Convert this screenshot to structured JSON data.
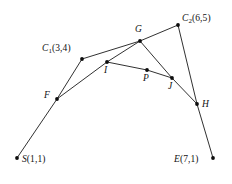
{
  "figure": {
    "width": 232,
    "height": 184,
    "background_color": "#ffffff",
    "stroke_color": "#1a1a1a",
    "point_color": "#0d0d0d"
  },
  "points": [
    {
      "id": "S",
      "label": "S(1,1)",
      "name": "S",
      "coord_text": "(1,1)",
      "x": 17,
      "y": 158,
      "label_x": 22,
      "label_y": 155,
      "has_sub": false
    },
    {
      "id": "C1",
      "label": "C1(3,4)",
      "name": "C",
      "sub": "1",
      "coord_text": "(3,4)",
      "x": 82,
      "y": 59,
      "label_x": 42,
      "label_y": 44,
      "has_sub": true
    },
    {
      "id": "C2",
      "label": "C2(6,5)",
      "name": "C",
      "sub": "2",
      "coord_text": "(6,5)",
      "x": 178,
      "y": 25,
      "label_x": 182,
      "label_y": 14,
      "has_sub": true
    },
    {
      "id": "E",
      "label": "E(7,1)",
      "name": "E",
      "coord_text": "(7,1)",
      "x": 213,
      "y": 158,
      "label_x": 174,
      "label_y": 155,
      "has_sub": false
    },
    {
      "id": "F",
      "label": "F",
      "name": "F",
      "x": 57,
      "y": 99,
      "label_x": 44,
      "label_y": 91,
      "has_sub": false
    },
    {
      "id": "G",
      "label": "G",
      "name": "G",
      "x": 140,
      "y": 41,
      "label_x": 135,
      "label_y": 25,
      "has_sub": false
    },
    {
      "id": "H",
      "label": "H",
      "name": "H",
      "x": 197,
      "y": 104,
      "label_x": 202,
      "label_y": 100,
      "has_sub": false
    },
    {
      "id": "I",
      "label": "I",
      "name": "I",
      "x": 107,
      "y": 62,
      "label_x": 104,
      "label_y": 66,
      "has_sub": false
    },
    {
      "id": "J",
      "label": "J",
      "name": "J",
      "x": 172,
      "y": 78,
      "label_x": 168,
      "label_y": 82,
      "has_sub": false
    },
    {
      "id": "P",
      "label": "P",
      "name": "P",
      "x": 147,
      "y": 70,
      "label_x": 143,
      "label_y": 74,
      "has_sub": false
    }
  ],
  "segments": [
    {
      "id": "S-F",
      "from": "S",
      "to": "F",
      "x1": 17,
      "y1": 158,
      "x2": 57,
      "y2": 99
    },
    {
      "id": "F-C1",
      "from": "F",
      "to": "C1",
      "x1": 57,
      "y1": 99,
      "x2": 82,
      "y2": 59
    },
    {
      "id": "C1-G",
      "from": "C1",
      "to": "G",
      "x1": 82,
      "y1": 59,
      "x2": 140,
      "y2": 41
    },
    {
      "id": "G-C2",
      "from": "G",
      "to": "C2",
      "x1": 140,
      "y1": 41,
      "x2": 178,
      "y2": 25
    },
    {
      "id": "C2-H",
      "from": "C2",
      "to": "H",
      "x1": 178,
      "y1": 25,
      "x2": 197,
      "y2": 104
    },
    {
      "id": "H-E",
      "from": "H",
      "to": "E",
      "x1": 197,
      "y1": 104,
      "x2": 213,
      "y2": 158
    },
    {
      "id": "F-I",
      "from": "F",
      "to": "I",
      "x1": 57,
      "y1": 99,
      "x2": 107,
      "y2": 62
    },
    {
      "id": "I-G",
      "from": "I",
      "to": "G",
      "x1": 107,
      "y1": 62,
      "x2": 140,
      "y2": 41
    },
    {
      "id": "G-J",
      "from": "G",
      "to": "J",
      "x1": 140,
      "y1": 41,
      "x2": 172,
      "y2": 78
    },
    {
      "id": "J-H",
      "from": "J",
      "to": "H",
      "x1": 172,
      "y1": 78,
      "x2": 197,
      "y2": 104
    },
    {
      "id": "I-P",
      "from": "I",
      "to": "P",
      "x1": 107,
      "y1": 62,
      "x2": 147,
      "y2": 70
    },
    {
      "id": "P-J",
      "from": "P",
      "to": "J",
      "x1": 147,
      "y1": 70,
      "x2": 172,
      "y2": 78
    }
  ]
}
